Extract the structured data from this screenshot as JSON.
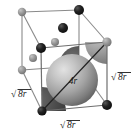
{
  "figure": {
    "name": "bcc-unit-cell-diagram",
    "type": "crystal-lattice-unit-cell",
    "colors": {
      "line": "#7a7a7a",
      "line_dark": "#3c3c3c",
      "atom_dark": "#141414",
      "atom_gray": "#8d8d8d",
      "sphere_light": "#d8d8d8",
      "sphere_mid": "#9a9a9a",
      "sphere_dark": "#4a4a4a",
      "wedge_dark": "#3f3f3f",
      "background": "#ffffff",
      "text": "#1a1a1a"
    }
  },
  "labels": {
    "center_sphere": "4r",
    "edge_bottom": "8r",
    "edge_left": "8r",
    "edge_right": "8r",
    "radical_symbol": "√"
  },
  "label_full": {
    "center_sphere": "4r",
    "edge_bottom": "√8r",
    "edge_left": "√8r",
    "edge_right": "√8r"
  },
  "geometry": {
    "cube_vertices": {
      "back_top_left": [
        22,
        12
      ],
      "back_top_right": [
        79,
        10
      ],
      "front_top_right": [
        107,
        42
      ],
      "front_top_left": [
        41,
        48
      ],
      "back_bottom_left": [
        22,
        70
      ],
      "back_bottom_right": [
        79,
        66
      ],
      "front_bottom_right": [
        107,
        105
      ],
      "front_bottom_left": [
        42,
        111
      ]
    },
    "center_sphere": {
      "cx": 72,
      "cy": 80,
      "r": 26
    },
    "body_diagonal": {
      "from": [
        42,
        111
      ],
      "to": [
        107,
        42
      ]
    },
    "interior_atoms": [
      {
        "cx": 63,
        "cy": 28,
        "r": 5.0,
        "shade": "dark"
      },
      {
        "cx": 55,
        "cy": 42,
        "r": 4.0,
        "shade": "gray"
      },
      {
        "cx": 33,
        "cy": 58,
        "r": 4.0,
        "shade": "gray"
      }
    ]
  }
}
